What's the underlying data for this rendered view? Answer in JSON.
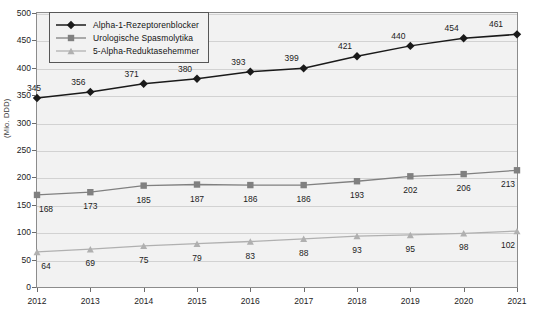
{
  "chart_data": {
    "type": "line",
    "title": "",
    "xlabel": "",
    "ylabel": "(Mio. DDD)",
    "categories": [
      "2012",
      "2013",
      "2014",
      "2015",
      "2016",
      "2017",
      "2018",
      "2019",
      "2020",
      "2021"
    ],
    "ylim": [
      0,
      500
    ],
    "yticks": [
      0,
      50,
      100,
      150,
      200,
      250,
      300,
      350,
      400,
      450,
      500
    ],
    "grid": true,
    "legend_position": "top-left",
    "series": [
      {
        "name": "Alpha-1-Rezeptorenblocker",
        "marker": "diamond",
        "color": "#1a1a1a",
        "values": [
          345,
          356,
          371,
          380,
          393,
          399,
          421,
          440,
          454,
          461
        ]
      },
      {
        "name": "Urologische Spasmolytika",
        "marker": "square",
        "color": "#808080",
        "values": [
          168,
          173,
          185,
          187,
          186,
          186,
          193,
          202,
          206,
          213
        ]
      },
      {
        "name": "5-Alpha-Reduktasehemmer",
        "marker": "triangle",
        "color": "#b0b0b0",
        "values": [
          64,
          69,
          75,
          79,
          83,
          88,
          93,
          95,
          98,
          102
        ]
      }
    ]
  },
  "style": {
    "plot_background": "#f2f2f2",
    "grid_color": "#d2d2d2",
    "frame_color": "#8c8c8c",
    "text_color": "#1c1c1c"
  }
}
